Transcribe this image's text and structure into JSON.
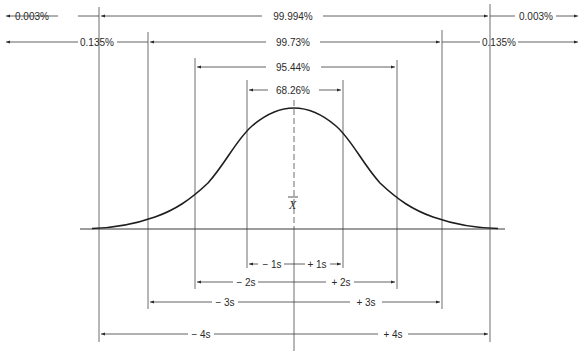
{
  "diagram": {
    "type": "normal-distribution-coverage",
    "center_label": "X",
    "top_intervals": [
      {
        "id": "outer-4s",
        "left_tail": "0.003%",
        "middle": "99.994%",
        "right_tail": "0.003%"
      },
      {
        "id": "outer-3s",
        "left_tail": "0.135%",
        "middle": "99.73%",
        "right_tail": "0.135%"
      },
      {
        "id": "range-2s",
        "middle": "95.44%"
      },
      {
        "id": "range-1s",
        "middle": "68.26%"
      }
    ],
    "bottom_intervals": [
      {
        "id": "1s",
        "minus": "− 1s",
        "plus": "+ 1s"
      },
      {
        "id": "2s",
        "minus": "− 2s",
        "plus": "+ 2s"
      },
      {
        "id": "3s",
        "minus": "− 3s",
        "plus": "+ 3s"
      },
      {
        "id": "4s",
        "minus": "− 4s",
        "plus": "+ 4s"
      }
    ],
    "line_color": "#2a2a2a",
    "curve_color": "#1e1e1e"
  }
}
